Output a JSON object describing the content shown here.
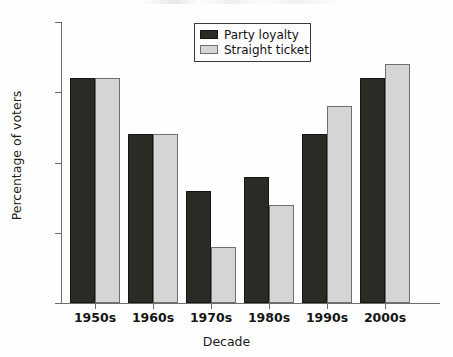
{
  "chart_data": {
    "type": "bar",
    "title": "",
    "xlabel": "Decade",
    "ylabel": "Percentage of voters",
    "categories": [
      "1950s",
      "1960s",
      "1970s",
      "1980s",
      "1990s",
      "2000s"
    ],
    "series": [
      {
        "name": "Party loyalty",
        "color": "#2b2a24",
        "values": [
          86,
          82,
          78,
          79,
          82,
          86
        ]
      },
      {
        "name": "Straight ticket",
        "color": "#d5d5d5",
        "values": [
          86,
          82,
          74,
          77,
          84,
          87
        ]
      }
    ],
    "ylim": [
      70,
      90
    ],
    "yticks": [
      70,
      75,
      80,
      85,
      90
    ],
    "ytick_labels": [
      "70",
      "75",
      "80",
      "85",
      "90"
    ],
    "grid": false,
    "legend_position": "top-center"
  },
  "legend": {
    "items": [
      {
        "label": "Party loyalty"
      },
      {
        "label": "Straight ticket"
      }
    ]
  }
}
